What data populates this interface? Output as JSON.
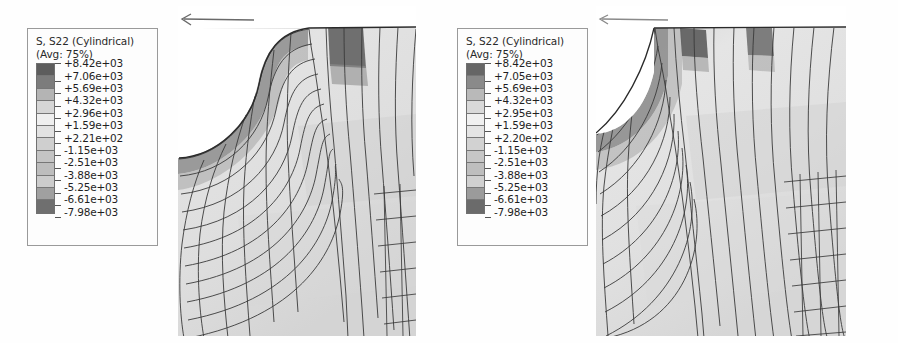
{
  "figure": {
    "background_color": "#ffffff",
    "panel_count": 2
  },
  "legends": [
    {
      "id": "legend-left",
      "title": "S, S22 (Cylindrical)",
      "subtitle": "(Avg: 75%)",
      "values": [
        "+8.42e+03",
        "+7.06e+03",
        "+5.69e+03",
        "+4.32e+03",
        "+2.96e+03",
        "+1.59e+03",
        "+2.21e+02",
        "-1.15e+03",
        "-2.51e+03",
        "-3.88e+03",
        "-5.25e+03",
        "-6.61e+03",
        "-7.98e+03"
      ],
      "band_colors": [
        "#5d5d5d",
        "#7c7c7c",
        "#b4b4b4",
        "#d6d6d6",
        "#efefef",
        "#e2e2e2",
        "#cfcfcf",
        "#c4c4c4",
        "#bdbdbd",
        "#cccccc",
        "#a0a0a0",
        "#6f6f6f"
      ]
    },
    {
      "id": "legend-right",
      "title": "S, S22 (Cylindrical)",
      "subtitle": "(Avg: 75%)",
      "values": [
        "+8.42e+03",
        "+7.05e+03",
        "+5.69e+03",
        "+4.32e+03",
        "+2.95e+03",
        "+1.59e+03",
        "+2.20e+02",
        "-1.15e+03",
        "-2.51e+03",
        "-3.88e+03",
        "-5.25e+03",
        "-6.61e+03",
        "-7.98e+03"
      ],
      "band_colors": [
        "#666666",
        "#8a8a8a",
        "#b9b9b9",
        "#d9d9d9",
        "#f0f0f0",
        "#e4e4e4",
        "#d2d2d2",
        "#c6c6c6",
        "#bebebe",
        "#d0d0d0",
        "#9b9b9b",
        "#6b6b6b"
      ]
    }
  ],
  "plots": [
    {
      "id": "plot-left",
      "variable": "S22",
      "coordinate_system": "Cylindrical",
      "averaging": "75%",
      "axis_indicator": "axis-arrow-left",
      "mesh_type": "quadrilateral",
      "feature": "curved fillet / hole boundary",
      "hotspots": 1
    },
    {
      "id": "plot-right",
      "variable": "S22",
      "coordinate_system": "Cylindrical",
      "averaging": "75%",
      "axis_indicator": "axis-arrow-left",
      "mesh_type": "quadrilateral",
      "feature": "curved fillet / hole boundary",
      "hotspots": 2
    }
  ],
  "chart_data": {
    "type": "heatmap",
    "title": "S, S22 (Cylindrical)",
    "subtitle": "(Avg: 75%)",
    "colorbar_label": "S, S22 (Cylindrical)",
    "units": "stress",
    "legend_position": "left of each panel",
    "grid": true,
    "panels": [
      {
        "name": "Left contour plot",
        "contour_levels": [
          8420,
          7060,
          5690,
          4320,
          2960,
          1590,
          221,
          -1150,
          -2510,
          -3880,
          -5250,
          -6610,
          -7980
        ],
        "level_labels": [
          "+8.42e+03",
          "+7.06e+03",
          "+5.69e+03",
          "+4.32e+03",
          "+2.96e+03",
          "+1.59e+03",
          "+2.21e+02",
          "-1.15e+03",
          "-2.51e+03",
          "-3.88e+03",
          "-5.25e+03",
          "-6.61e+03",
          "-7.98e+03"
        ],
        "zlim": [
          -7980,
          8420
        ],
        "colormap": "grayscale"
      },
      {
        "name": "Right contour plot",
        "contour_levels": [
          8420,
          7050,
          5690,
          4320,
          2950,
          1590,
          220,
          -1150,
          -2510,
          -3880,
          -5250,
          -6610,
          -7980
        ],
        "level_labels": [
          "+8.42e+03",
          "+7.05e+03",
          "+5.69e+03",
          "+4.32e+03",
          "+2.95e+03",
          "+1.59e+03",
          "+2.20e+02",
          "-1.15e+03",
          "-2.51e+03",
          "-3.88e+03",
          "-5.25e+03",
          "-6.61e+03",
          "-7.98e+03"
        ],
        "zlim": [
          -7980,
          8420
        ],
        "colormap": "grayscale"
      }
    ]
  }
}
